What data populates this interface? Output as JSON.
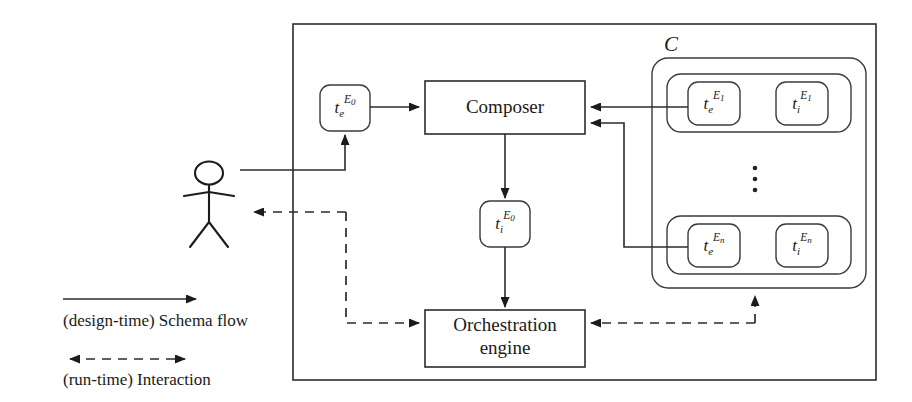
{
  "figure": {
    "outer_frame": {
      "name": "system-boundary"
    }
  },
  "nodes": {
    "composer": {
      "label": "Composer"
    },
    "orchestration": {
      "label_line1": "Orchestration",
      "label_line2": "engine"
    },
    "te_e0": {
      "base": "t",
      "sub": "e",
      "sup": "E",
      "sup_index": "0"
    },
    "ti_e0": {
      "base": "t",
      "sub": "i",
      "sup": "E",
      "sup_index": "0"
    },
    "te_e1": {
      "base": "t",
      "sub": "e",
      "sup": "E",
      "sup_index": "1"
    },
    "ti_e1": {
      "base": "t",
      "sub": "i",
      "sup": "E",
      "sup_index": "1"
    },
    "te_en": {
      "base": "t",
      "sub": "e",
      "sup": "E",
      "sup_index": "n"
    },
    "ti_en": {
      "base": "t",
      "sub": "i",
      "sup": "E",
      "sup_index": "n"
    }
  },
  "groups": {
    "collection": {
      "label": "C",
      "vertical_ellipsis": "⋮"
    }
  },
  "actor": {
    "name": "user-actor"
  },
  "legend": {
    "items": [
      {
        "id": "design-time",
        "label": "(design-time) Schema flow",
        "arrow": "solid-single"
      },
      {
        "id": "run-time",
        "label": "(run-time) Interaction",
        "arrow": "dashed-double"
      }
    ]
  },
  "colors": {
    "stroke": "#2b2b2b",
    "text": "#1a1a1a",
    "background": "#ffffff"
  }
}
